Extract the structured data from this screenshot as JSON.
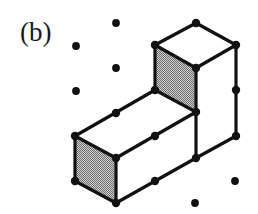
{
  "figure": {
    "panel_label": "(b)",
    "label_position": {
      "x": 20,
      "y": 41
    },
    "canvas": {
      "width": 258,
      "height": 214
    },
    "background_color": "#ffffff",
    "edge_color": "#111111",
    "shaded_face_color": "#a8a8a8",
    "white_face_color": "#ffffff",
    "vertex_dot_color": "#111111",
    "vertex_dot_radius": 4.2,
    "lattice_dot_radius": 3.9,
    "edge_width": 3.2,
    "lattice": {
      "origin": {
        "x": 75,
        "y": 68
      },
      "step_x": 40.5,
      "step_y": 22.5
    },
    "solid": {
      "type": "L-tromino-polycube",
      "cube_count": 3,
      "vertices": {
        "top_apex": {
          "x": 196,
          "y": 23,
          "name": "top-cube-top-apex"
        },
        "top_left": {
          "x": 155,
          "y": 45,
          "name": "top-cube-top-left"
        },
        "top_right": {
          "x": 236,
          "y": 45,
          "name": "top-cube-top-right"
        },
        "top_front": {
          "x": 196,
          "y": 68,
          "name": "top-cube-top-front"
        },
        "mid_left": {
          "x": 155,
          "y": 90,
          "name": "riser-front-left"
        },
        "mid_front": {
          "x": 196,
          "y": 112,
          "name": "riser-front-bottom"
        },
        "right_mid": {
          "x": 236,
          "y": 90,
          "name": "right-edge-midpoint"
        },
        "right_bottom": {
          "x": 236,
          "y": 136,
          "name": "right-lower-corner"
        },
        "arm_top_left": {
          "x": 75,
          "y": 136,
          "name": "arm-top-left"
        },
        "arm_top_mid": {
          "x": 116,
          "y": 113,
          "name": "arm-top-midpoint"
        },
        "arm_front_mid": {
          "x": 155,
          "y": 136,
          "name": "arm-top-front-midpoint"
        },
        "arm_front_left": {
          "x": 116,
          "y": 158,
          "name": "arm-front-left"
        },
        "arm_bottom_left": {
          "x": 75,
          "y": 181,
          "name": "arm-bottom-left"
        },
        "arm_bottom_mid": {
          "x": 116,
          "y": 203,
          "name": "arm-bottom-front"
        },
        "arm_low_mid": {
          "x": 155,
          "y": 181,
          "name": "arm-bottom-midpoint"
        },
        "arm_low_right": {
          "x": 196,
          "y": 158,
          "name": "arm-bottom-right"
        }
      },
      "shaded_faces": [
        {
          "name": "riser-left-face",
          "points": "155,45 196,68 196,112 155,90"
        },
        {
          "name": "arm-left-end-face",
          "points": "75,136 116,158 116,203 75,181"
        }
      ],
      "white_faces": [
        {
          "name": "top-cube-top-face",
          "points": "196,23 236,45 196,68 155,45"
        },
        {
          "name": "top-cube-right-face",
          "points": "236,45 236,90 196,112 196,68"
        },
        {
          "name": "arm-top-face",
          "points": "75,136 116,113 155,90 196,112 155,136 116,158"
        },
        {
          "name": "arm-front-face",
          "points": "116,158 196,158 196,112 155,136 155,181 116,203"
        },
        {
          "name": "arm-right-lower-face",
          "points": "196,112 236,90 236,136 196,158"
        }
      ],
      "edges": [
        {
          "name": "top-apex-to-top-left",
          "x1": 196,
          "y1": 23,
          "x2": 155,
          "y2": 45
        },
        {
          "name": "top-apex-to-top-right",
          "x1": 196,
          "y1": 23,
          "x2": 236,
          "y2": 45
        },
        {
          "name": "top-left-to-top-front",
          "x1": 155,
          "y1": 45,
          "x2": 196,
          "y2": 68
        },
        {
          "name": "top-right-to-top-front",
          "x1": 236,
          "y1": 45,
          "x2": 196,
          "y2": 68
        },
        {
          "name": "top-left-to-mid-left",
          "x1": 155,
          "y1": 45,
          "x2": 155,
          "y2": 90
        },
        {
          "name": "top-front-to-mid-front",
          "x1": 196,
          "y1": 68,
          "x2": 196,
          "y2": 112
        },
        {
          "name": "right-vertical-edge",
          "x1": 236,
          "y1": 45,
          "x2": 236,
          "y2": 136
        },
        {
          "name": "mid-left-to-mid-front",
          "x1": 155,
          "y1": 90,
          "x2": 196,
          "y2": 112
        },
        {
          "name": "mid-front-to-right-bottom",
          "x1": 196,
          "y1": 158,
          "x2": 236,
          "y2": 136
        },
        {
          "name": "arm-top-back-edge",
          "x1": 75,
          "y1": 136,
          "x2": 155,
          "y2": 90
        },
        {
          "name": "arm-top-front-edge",
          "x1": 116,
          "y1": 158,
          "x2": 196,
          "y2": 112
        },
        {
          "name": "arm-top-left-short-edge",
          "x1": 75,
          "y1": 136,
          "x2": 116,
          "y2": 158
        },
        {
          "name": "arm-left-vertical-edge",
          "x1": 75,
          "y1": 136,
          "x2": 75,
          "y2": 181
        },
        {
          "name": "arm-front-vertical-edge",
          "x1": 116,
          "y1": 158,
          "x2": 116,
          "y2": 203
        },
        {
          "name": "arm-bottom-left-edge",
          "x1": 75,
          "y1": 181,
          "x2": 116,
          "y2": 203
        },
        {
          "name": "arm-bottom-front-edge",
          "x1": 116,
          "y1": 203,
          "x2": 196,
          "y2": 158
        },
        {
          "name": "arm-right-vertical-edge",
          "x1": 196,
          "y1": 112,
          "x2": 196,
          "y2": 158
        }
      ],
      "vertex_dots": [
        {
          "name": "vertex-top-apex",
          "x": 196,
          "y": 23
        },
        {
          "name": "vertex-top-left",
          "x": 155,
          "y": 45
        },
        {
          "name": "vertex-top-right",
          "x": 236,
          "y": 45
        },
        {
          "name": "vertex-top-front",
          "x": 196,
          "y": 68
        },
        {
          "name": "vertex-mid-left",
          "x": 155,
          "y": 90
        },
        {
          "name": "vertex-right-mid",
          "x": 236,
          "y": 90
        },
        {
          "name": "vertex-arm-top-mid",
          "x": 116,
          "y": 113
        },
        {
          "name": "vertex-mid-front",
          "x": 196,
          "y": 112
        },
        {
          "name": "vertex-arm-top-left",
          "x": 75,
          "y": 136
        },
        {
          "name": "vertex-arm-front-mid",
          "x": 155,
          "y": 136
        },
        {
          "name": "vertex-right-bottom",
          "x": 236,
          "y": 136
        },
        {
          "name": "vertex-arm-front-left",
          "x": 116,
          "y": 158
        },
        {
          "name": "vertex-arm-low-right",
          "x": 196,
          "y": 158
        },
        {
          "name": "vertex-arm-bottom-left",
          "x": 75,
          "y": 181
        },
        {
          "name": "vertex-arm-low-mid",
          "x": 155,
          "y": 181
        },
        {
          "name": "vertex-arm-bottom-mid",
          "x": 116,
          "y": 203
        }
      ]
    },
    "free_lattice_dots": [
      {
        "name": "lattice-dot-top-1",
        "x": 116,
        "y": 23
      },
      {
        "name": "lattice-dot-upper-1",
        "x": 76,
        "y": 46
      },
      {
        "name": "lattice-dot-upper-2",
        "x": 116,
        "y": 68
      },
      {
        "name": "lattice-dot-upper-3",
        "x": 76,
        "y": 91
      },
      {
        "name": "lattice-dot-lower-1",
        "x": 235,
        "y": 181
      },
      {
        "name": "lattice-dot-lower-2",
        "x": 195,
        "y": 203
      }
    ]
  }
}
